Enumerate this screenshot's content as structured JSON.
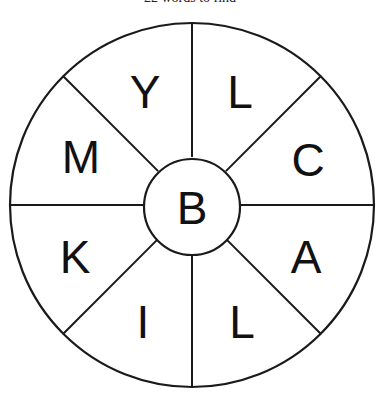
{
  "puzzle": {
    "title": "22 words to find",
    "center_letter": "B",
    "outer_letters": [
      {
        "letter": "Y",
        "x": 145,
        "y": 92
      },
      {
        "letter": "L",
        "x": 240,
        "y": 92
      },
      {
        "letter": "C",
        "x": 308,
        "y": 160
      },
      {
        "letter": "A",
        "x": 306,
        "y": 257
      },
      {
        "letter": "L",
        "x": 242,
        "y": 322
      },
      {
        "letter": "I",
        "x": 143,
        "y": 322
      },
      {
        "letter": "K",
        "x": 75,
        "y": 257
      },
      {
        "letter": "M",
        "x": 81,
        "y": 157
      }
    ]
  },
  "geometry": {
    "cx": 192,
    "cy": 205,
    "outer_r": 182,
    "inner_r": 48,
    "stroke_color": "#1a1a1a",
    "background": "#ffffff"
  }
}
